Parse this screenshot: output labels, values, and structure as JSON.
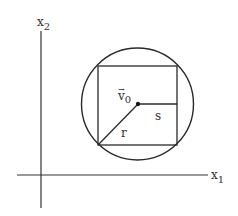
{
  "diagram": {
    "axes": {
      "x1_label": "x",
      "x1_subscript": "1",
      "x2_label": "x",
      "x2_subscript": "2"
    },
    "labels": {
      "vector_v0": "v",
      "vector_v0_subscript": "0",
      "vector_arrow": "→",
      "s": "s",
      "r": "r"
    },
    "colors": {
      "stroke": "#2a2a2a",
      "background": "#ffffff"
    }
  }
}
